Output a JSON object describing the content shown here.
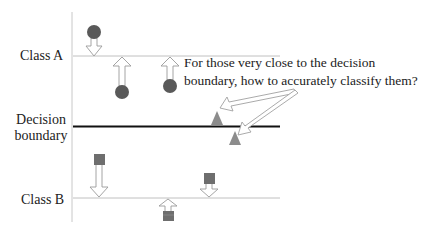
{
  "labels": {
    "class_a": "Class A",
    "decision_line1": "Decision",
    "decision_line2": "boundary",
    "class_b": "Class B"
  },
  "annotation": {
    "line1": "For those very close to the decision",
    "line2": "boundary, how to accurately classify them?"
  },
  "colors": {
    "axis": "#bfbfbf",
    "class_line": "#bfbfbf",
    "boundary": "#111111",
    "circle": "#595959",
    "triangle": "#8c8c8c",
    "square": "#6e6e6e",
    "arrow_outline": "#9a9a9a"
  },
  "elements": {
    "circles": [
      {
        "cx": 94,
        "cy": 32,
        "arrow": "down-to-class-a"
      },
      {
        "cx": 122,
        "cy": 92,
        "arrow": "up-to-class-a"
      },
      {
        "cx": 170,
        "cy": 86,
        "arrow": "up-to-class-a"
      }
    ],
    "triangles": [
      {
        "cx": 216,
        "cy": 118,
        "position": "above-boundary"
      },
      {
        "cx": 236,
        "cy": 138,
        "position": "below-boundary"
      }
    ],
    "squares": [
      {
        "x": 93,
        "y": 153,
        "arrow": "down-to-class-b"
      },
      {
        "x": 203,
        "y": 173,
        "arrow": "down-to-class-b"
      },
      {
        "x": 163,
        "y": 208,
        "arrow": "up-to-class-b"
      }
    ]
  }
}
